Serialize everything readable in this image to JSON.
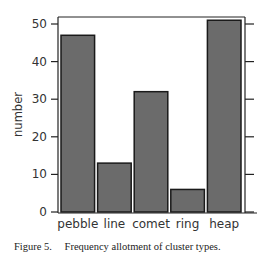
{
  "chart_data": {
    "type": "bar",
    "title": "",
    "xlabel": "",
    "ylabel": "number",
    "categories": [
      "pebble",
      "line",
      "comet",
      "ring",
      "heap"
    ],
    "values": [
      47,
      13,
      32,
      6,
      51
    ],
    "ylim": [
      0,
      52
    ],
    "yticks": [
      0,
      10,
      20,
      30,
      40,
      50
    ],
    "grid": false,
    "legend": null,
    "bar_color": "#6b6b6b",
    "bar_edge_color": "#1a1a1a",
    "right_axis_ticks": true
  },
  "caption": {
    "label": "Figure 5.",
    "text": "Frequency allotment of cluster types."
  }
}
